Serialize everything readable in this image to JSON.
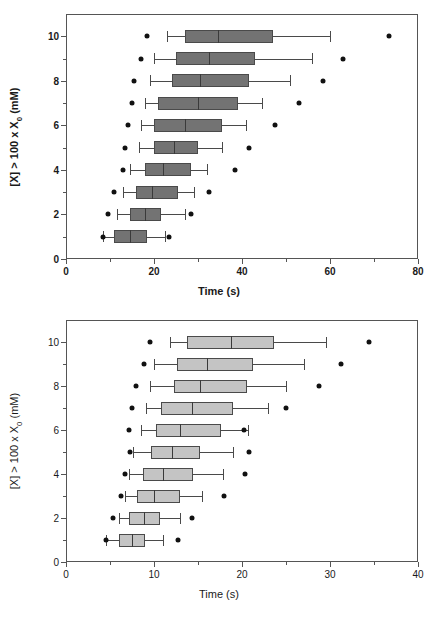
{
  "chart_data": [
    {
      "id": "top",
      "type": "box",
      "orientation": "horizontal",
      "title": "",
      "xlabel": "Time (s)",
      "ylabel": "[X] > 100 x X0 (mM)",
      "ylabel_parts": {
        "pre": "[X] > 100 x X",
        "sub": "0",
        "post": " (mM)"
      },
      "xlim": [
        0,
        80
      ],
      "ylim": [
        0,
        11
      ],
      "xticks": [
        0,
        20,
        40,
        60,
        80
      ],
      "xtick_labels": [
        "0",
        "20",
        "40",
        "60",
        "80"
      ],
      "x_minor_ticks": [
        10,
        30,
        50,
        70
      ],
      "yticks": [
        0,
        2,
        4,
        6,
        8,
        10
      ],
      "ytick_labels": [
        "0",
        "2",
        "4",
        "6",
        "8",
        "10"
      ],
      "y_minor_ticks": [
        1,
        3,
        5,
        7,
        9
      ],
      "grid": false,
      "legend": "none",
      "box_fill": "#737373",
      "box_edge": "#4a4a4a",
      "outlier_color": "#111111",
      "boxes": [
        {
          "category": "10",
          "y": 10,
          "whisker_low": 23.0,
          "q1": 27.0,
          "median": 34.5,
          "q3": 47.0,
          "whisker_high": 60.0,
          "outliers": [
            18.5,
            73.5
          ]
        },
        {
          "category": "9",
          "y": 9,
          "whisker_low": 20.0,
          "q1": 25.0,
          "median": 32.5,
          "q3": 43.0,
          "whisker_high": 56.0,
          "outliers": [
            17.0,
            63.0
          ]
        },
        {
          "category": "8",
          "y": 8,
          "whisker_low": 19.0,
          "q1": 24.0,
          "median": 30.5,
          "q3": 41.5,
          "whisker_high": 51.0,
          "outliers": [
            15.5,
            58.5
          ]
        },
        {
          "category": "7",
          "y": 7,
          "whisker_low": 18.0,
          "q1": 21.0,
          "median": 30.0,
          "q3": 39.0,
          "whisker_high": 44.5,
          "outliers": [
            15.0,
            53.0
          ]
        },
        {
          "category": "6",
          "y": 6,
          "whisker_low": 17.0,
          "q1": 20.0,
          "median": 27.0,
          "q3": 35.5,
          "whisker_high": 41.0,
          "outliers": [
            14.0,
            47.5
          ]
        },
        {
          "category": "5",
          "y": 5,
          "whisker_low": 16.5,
          "q1": 20.0,
          "median": 24.5,
          "q3": 30.0,
          "whisker_high": 35.5,
          "outliers": [
            13.5,
            41.5
          ]
        },
        {
          "category": "4",
          "y": 4,
          "whisker_low": 14.5,
          "q1": 18.0,
          "median": 22.0,
          "q3": 28.5,
          "whisker_high": 32.0,
          "outliers": [
            13.0,
            38.5
          ]
        },
        {
          "category": "3",
          "y": 3,
          "whisker_low": 13.0,
          "q1": 16.0,
          "median": 19.5,
          "q3": 25.5,
          "whisker_high": 29.0,
          "outliers": [
            11.0,
            32.5
          ]
        },
        {
          "category": "2",
          "y": 2,
          "whisker_low": 11.5,
          "q1": 14.5,
          "median": 18.0,
          "q3": 21.5,
          "whisker_high": 27.0,
          "outliers": [
            9.5,
            28.5
          ]
        },
        {
          "category": "1",
          "y": 1,
          "whisker_low": 8.5,
          "q1": 11.0,
          "median": 14.5,
          "q3": 18.5,
          "whisker_high": 22.5,
          "outliers": [
            8.5,
            23.5
          ]
        }
      ]
    },
    {
      "id": "bottom",
      "type": "box",
      "orientation": "horizontal",
      "title": "",
      "xlabel": "Time (s)",
      "ylabel": "[X] > 100 x X0 (mM)",
      "ylabel_parts": {
        "pre": "[X] > 100 x X",
        "sub": "0",
        "post": " (mM)"
      },
      "xlim": [
        0,
        40
      ],
      "ylim": [
        0,
        11
      ],
      "xticks": [
        0,
        10,
        20,
        30,
        40
      ],
      "xtick_labels": [
        "0",
        "10",
        "20",
        "30",
        "40"
      ],
      "x_minor_ticks": [
        5,
        15,
        25,
        35
      ],
      "yticks": [
        0,
        2,
        4,
        6,
        8,
        10
      ],
      "ytick_labels": [
        "0",
        "2",
        "4",
        "6",
        "8",
        "10"
      ],
      "y_minor_ticks": [
        1,
        3,
        5,
        7,
        9
      ],
      "grid": false,
      "legend": "none",
      "box_fill": "#c4c4c4",
      "box_edge": "#4a4a4a",
      "outlier_color": "#111111",
      "boxes": [
        {
          "category": "10",
          "y": 10,
          "whisker_low": 11.8,
          "q1": 13.8,
          "median": 18.8,
          "q3": 23.6,
          "whisker_high": 29.6,
          "outliers": [
            9.5,
            34.4
          ]
        },
        {
          "category": "9",
          "y": 9,
          "whisker_low": 10.0,
          "q1": 12.6,
          "median": 16.0,
          "q3": 21.2,
          "whisker_high": 27.0,
          "outliers": [
            8.9,
            31.2
          ]
        },
        {
          "category": "8",
          "y": 8,
          "whisker_low": 9.5,
          "q1": 12.3,
          "median": 15.2,
          "q3": 20.6,
          "whisker_high": 25.0,
          "outliers": [
            8.0,
            28.7
          ]
        },
        {
          "category": "7",
          "y": 7,
          "whisker_low": 9.1,
          "q1": 10.8,
          "median": 14.3,
          "q3": 19.0,
          "whisker_high": 23.0,
          "outliers": [
            7.5,
            25.0
          ]
        },
        {
          "category": "6",
          "y": 6,
          "whisker_low": 8.5,
          "q1": 10.2,
          "median": 13.0,
          "q3": 17.6,
          "whisker_high": 20.7,
          "outliers": [
            7.2,
            20.2
          ]
        },
        {
          "category": "5",
          "y": 5,
          "whisker_low": 7.6,
          "q1": 9.7,
          "median": 12.0,
          "q3": 15.2,
          "whisker_high": 19.0,
          "outliers": [
            7.3,
            20.8
          ]
        },
        {
          "category": "4",
          "y": 4,
          "whisker_low": 7.2,
          "q1": 8.8,
          "median": 11.0,
          "q3": 14.4,
          "whisker_high": 17.8,
          "outliers": [
            6.7,
            20.3
          ]
        },
        {
          "category": "3",
          "y": 3,
          "whisker_low": 6.7,
          "q1": 8.1,
          "median": 10.0,
          "q3": 13.0,
          "whisker_high": 15.4,
          "outliers": [
            6.2,
            18.0
          ]
        },
        {
          "category": "2",
          "y": 2,
          "whisker_low": 6.0,
          "q1": 7.2,
          "median": 8.9,
          "q3": 10.7,
          "whisker_high": 13.0,
          "outliers": [
            5.3,
            14.3
          ]
        },
        {
          "category": "1",
          "y": 1,
          "whisker_low": 4.6,
          "q1": 6.0,
          "median": 7.5,
          "q3": 9.0,
          "whisker_high": 11.0,
          "outliers": [
            4.5,
            12.7
          ]
        }
      ]
    }
  ],
  "figure": {
    "panel_top_label": "Top box plot panel",
    "panel_bottom_label": "Bottom box plot panel"
  }
}
